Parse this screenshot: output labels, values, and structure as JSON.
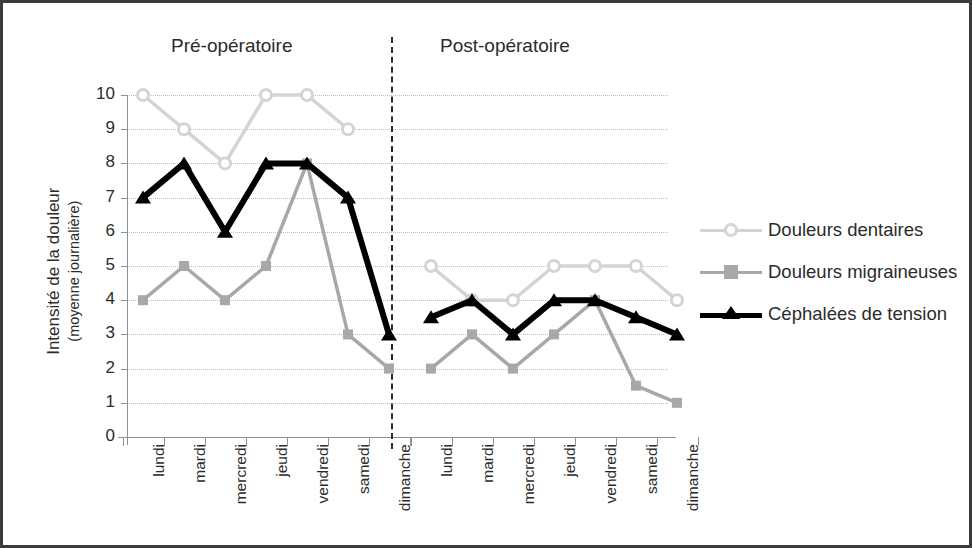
{
  "titles": {
    "pre": "Pré-opératoire",
    "post": "Post-opératoire"
  },
  "axes": {
    "y_caption_line1": "Intensité de la douleur",
    "y_caption_line2": "(moyenne journalière)",
    "y_ticks": [
      "10",
      "9",
      "8",
      "7",
      "6",
      "5",
      "4",
      "3",
      "2",
      "1",
      "0"
    ],
    "y_min": 0,
    "y_max": 10,
    "x_labels_pre": [
      "lundi",
      "mardi",
      "mercredi",
      "jeudi",
      "vendredi",
      "samedi",
      "dimanche"
    ],
    "x_labels_post": [
      "lundi",
      "mardi",
      "mercredi",
      "jeudi",
      "vendredi",
      "samedi",
      "dimanche"
    ]
  },
  "legend": {
    "items": [
      {
        "label": "Douleurs dentaires",
        "color": "#d4d4d4",
        "marker": "circle"
      },
      {
        "label": "Douleurs migraineuses",
        "color": "#a8a8a8",
        "marker": "square"
      },
      {
        "label": "Céphalées de tension",
        "color": "#000000",
        "marker": "triangle"
      }
    ]
  },
  "chart_data": {
    "type": "line",
    "title": "",
    "subtitle": "",
    "xlabel": "",
    "ylabel": "Intensité de la douleur (moyenne journalière)",
    "ylim": [
      0,
      10
    ],
    "grid": true,
    "legend_position": "right",
    "annotations": [
      "Pré-opératoire",
      "Post-opératoire"
    ],
    "panels": [
      "Pré-opératoire",
      "Post-opératoire"
    ],
    "categories": [
      "lundi",
      "mardi",
      "mercredi",
      "jeudi",
      "vendredi",
      "samedi",
      "dimanche",
      "lundi",
      "mardi",
      "mercredi",
      "jeudi",
      "vendredi",
      "samedi",
      "dimanche"
    ],
    "series": [
      {
        "name": "Douleurs dentaires",
        "color": "#d4d4d4",
        "marker": "circle",
        "values": [
          10,
          9,
          8,
          10,
          10,
          9,
          null,
          5,
          4,
          4,
          5,
          5,
          5,
          4
        ],
        "values_pre": [
          10,
          9,
          8,
          10,
          10,
          9,
          null
        ],
        "values_post": [
          5,
          4,
          4,
          5,
          5,
          5,
          4
        ]
      },
      {
        "name": "Douleurs migraineuses",
        "color": "#a8a8a8",
        "marker": "square",
        "values": [
          4,
          5,
          4,
          5,
          8,
          3,
          2,
          2,
          3,
          2,
          3,
          4,
          1.5,
          1
        ],
        "values_pre": [
          4,
          5,
          4,
          5,
          8,
          3,
          2
        ],
        "values_post": [
          2,
          3,
          2,
          3,
          4,
          1.5,
          1
        ]
      },
      {
        "name": "Céphalées de tension",
        "color": "#000000",
        "marker": "triangle",
        "values": [
          7,
          8,
          6,
          8,
          8,
          7,
          3,
          3.5,
          4,
          3,
          4,
          4,
          3.5,
          3
        ],
        "values_pre": [
          7,
          8,
          6,
          8,
          8,
          7,
          3
        ],
        "values_post": [
          3.5,
          4,
          3,
          4,
          4,
          3.5,
          3
        ]
      }
    ]
  }
}
